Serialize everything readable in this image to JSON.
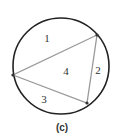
{
  "figure": {
    "caption": "(c)",
    "circle": {
      "cx": 61,
      "cy": 66,
      "r": 48,
      "stroke": "#222222"
    },
    "triangle": {
      "stroke": "#9a9a9a",
      "vertices": [
        {
          "name": "top-right",
          "x": 97,
          "y": 35
        },
        {
          "name": "left",
          "x": 13,
          "y": 75
        },
        {
          "name": "bottom",
          "x": 87,
          "y": 103
        }
      ]
    },
    "regions": [
      {
        "label": "1",
        "x": 47,
        "y": 42
      },
      {
        "label": "2",
        "x": 98,
        "y": 74
      },
      {
        "label": "3",
        "x": 44,
        "y": 103
      },
      {
        "label": "4",
        "x": 66,
        "y": 75
      }
    ]
  }
}
